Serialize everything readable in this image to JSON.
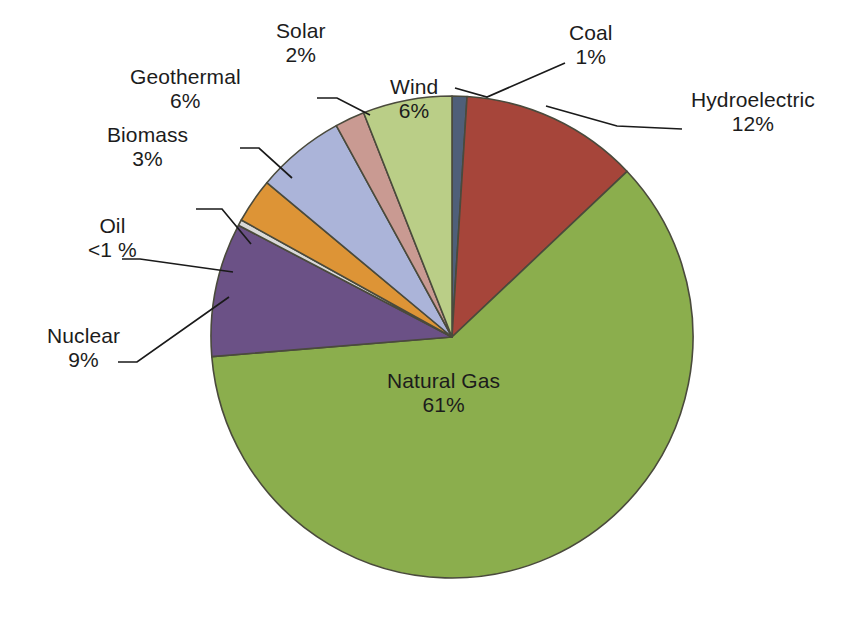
{
  "chart_data": {
    "type": "pie",
    "title": "",
    "subtitle": "",
    "xlabel": "",
    "ylabel": "",
    "legend_position": "none",
    "grid": false,
    "units": "percent",
    "categories": [
      "Coal",
      "Hydroelectric",
      "Natural Gas",
      "Nuclear",
      "Oil",
      "Biomass",
      "Geothermal",
      "Solar",
      "Wind"
    ],
    "values": [
      1,
      12,
      61,
      9,
      0.4,
      3,
      6,
      2,
      6
    ],
    "value_labels": [
      "1%",
      "12%",
      "61%",
      "9%",
      "<1 %",
      "3%",
      "6%",
      "2%",
      "6%"
    ],
    "colors": [
      "#4f5f79",
      "#a6453a",
      "#8bae4d",
      "#6b5186",
      "#d9d9d9",
      "#dd9436",
      "#abb4d9",
      "#c99a92",
      "#bace87"
    ],
    "start_angle_deg": 0,
    "direction": "clockwise",
    "slices": [
      {
        "label": "Coal",
        "value": 1,
        "value_label": "1%",
        "color": "#4f5f79",
        "label_placement": "outside",
        "label_x": 591,
        "label_y": 45,
        "leader": [
          [
            455,
            88
          ],
          [
            487,
            97
          ],
          [
            565,
            63
          ]
        ]
      },
      {
        "label": "Hydroelectric",
        "value": 12,
        "value_label": "12%",
        "color": "#a6453a",
        "label_placement": "outside",
        "label_x": 753,
        "label_y": 112,
        "leader": [
          [
            546,
            106
          ],
          [
            617,
            126
          ],
          [
            682,
            129
          ]
        ]
      },
      {
        "label": "Natural Gas",
        "value": 61,
        "value_label": "61%",
        "color": "#8bae4d",
        "label_placement": "inside",
        "label_x": 443,
        "label_y": 393,
        "leader": []
      },
      {
        "label": "Nuclear",
        "value": 9,
        "value_label": "9%",
        "color": "#6b5186",
        "label_placement": "outside",
        "label_x": 83,
        "label_y": 348,
        "leader": [
          [
            229,
            297
          ],
          [
            137,
            362
          ],
          [
            118,
            362
          ]
        ]
      },
      {
        "label": "Oil",
        "value": 0.4,
        "value_label": "<1 %",
        "color": "#d9d9d9",
        "label_placement": "outside",
        "label_x": 112,
        "label_y": 238,
        "leader": [
          [
            233,
            272
          ],
          [
            140,
            259
          ],
          [
            122,
            259
          ]
        ]
      },
      {
        "label": "Biomass",
        "value": 3,
        "value_label": "3%",
        "color": "#dd9436",
        "label_placement": "outside",
        "label_x": 147,
        "label_y": 147,
        "leader": [
          [
            251,
            244
          ],
          [
            222,
            209
          ],
          [
            196,
            209
          ]
        ]
      },
      {
        "label": "Geothermal",
        "value": 6,
        "value_label": "6%",
        "color": "#abb4d9",
        "label_placement": "outside",
        "label_x": 185,
        "label_y": 89,
        "leader": [
          [
            292,
            178
          ],
          [
            259,
            148
          ],
          [
            240,
            148
          ]
        ]
      },
      {
        "label": "Solar",
        "value": 2,
        "value_label": "2%",
        "color": "#c99a92",
        "label_placement": "outside",
        "label_x": 301,
        "label_y": 43,
        "leader": [
          [
            370,
            115
          ],
          [
            337,
            98
          ],
          [
            317,
            98
          ]
        ]
      },
      {
        "label": "Wind",
        "value": 6,
        "value_label": "6%",
        "color": "#bace87",
        "label_placement": "inside",
        "label_x": 414,
        "label_y": 99,
        "leader": []
      }
    ],
    "geometry": {
      "center_x": 452,
      "center_y": 337,
      "radius": 241,
      "stroke_color": "#4a4a3c",
      "stroke_width": 1.6
    }
  }
}
